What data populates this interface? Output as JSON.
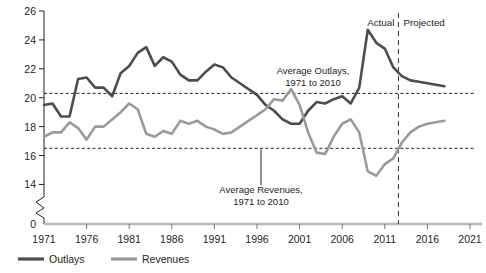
{
  "chart_data": {
    "type": "line",
    "title": "",
    "subtitle": "",
    "xlabel": "",
    "ylabel": "",
    "xlim": [
      1971,
      2021
    ],
    "ylim": [
      13.2,
      26
    ],
    "y_axis_break": true,
    "y_axis_zero_label": "0",
    "grid": false,
    "legend_position": "bottom-left",
    "x_ticks": [
      "1971",
      "1976",
      "1981",
      "1986",
      "1991",
      "1996",
      "2001",
      "2006",
      "2011",
      "2016",
      "2021"
    ],
    "y_ticks": [
      "0",
      "14",
      "16",
      "18",
      "20",
      "22",
      "24",
      "26"
    ],
    "x": [
      1971,
      1972,
      1973,
      1974,
      1975,
      1976,
      1977,
      1978,
      1979,
      1980,
      1981,
      1982,
      1983,
      1984,
      1985,
      1986,
      1987,
      1988,
      1989,
      1990,
      1991,
      1992,
      1993,
      1994,
      1995,
      1996,
      1997,
      1998,
      1999,
      2000,
      2001,
      2002,
      2003,
      2004,
      2005,
      2006,
      2007,
      2008,
      2009,
      2010,
      2011,
      2012,
      2013,
      2014,
      2015,
      2016,
      2017,
      2018
    ],
    "series": [
      {
        "name": "Outlays",
        "color": "#4d4d4d",
        "width": 2.6,
        "values": [
          19.5,
          19.6,
          18.7,
          18.7,
          21.3,
          21.4,
          20.7,
          20.7,
          20.1,
          21.7,
          22.2,
          23.1,
          23.5,
          22.2,
          22.8,
          22.5,
          21.6,
          21.2,
          21.2,
          21.8,
          22.3,
          22.1,
          21.4,
          21.0,
          20.6,
          20.2,
          19.5,
          19.1,
          18.5,
          18.2,
          18.2,
          19.1,
          19.7,
          19.6,
          19.9,
          20.1,
          19.6,
          20.7,
          24.7,
          23.8,
          23.4,
          22.1,
          21.5,
          21.2,
          21.1,
          21.0,
          20.9,
          20.8
        ]
      },
      {
        "name": "Revenues",
        "color": "#9a9a9a",
        "width": 2.6,
        "values": [
          17.3,
          17.6,
          17.6,
          18.3,
          17.9,
          17.1,
          18.0,
          18.0,
          18.5,
          19.0,
          19.6,
          19.2,
          17.5,
          17.3,
          17.7,
          17.5,
          18.4,
          18.2,
          18.4,
          18.0,
          17.8,
          17.5,
          17.6,
          18.0,
          18.4,
          18.8,
          19.2,
          19.9,
          19.8,
          20.6,
          19.5,
          17.6,
          16.2,
          16.1,
          17.3,
          18.2,
          18.5,
          17.6,
          14.9,
          14.6,
          15.4,
          15.8,
          16.9,
          17.6,
          18.0,
          18.2,
          18.3,
          18.4
        ]
      }
    ],
    "reference_lines": [
      {
        "name": "average-outlays",
        "value": 20.3,
        "label_line1": "Average Outlays,",
        "label_line2": "1971 to 2010"
      },
      {
        "name": "average-revenues",
        "value": 16.5,
        "label_line1": "Average Revenues,",
        "label_line2": "1971 to 2010"
      }
    ],
    "vertical_divider": {
      "x": 2012.6,
      "left_label": "Actual",
      "right_label": "Projected"
    },
    "legend": [
      {
        "label": "Outlays",
        "color": "#4d4d4d"
      },
      {
        "label": "Revenues",
        "color": "#9a9a9a"
      }
    ]
  }
}
